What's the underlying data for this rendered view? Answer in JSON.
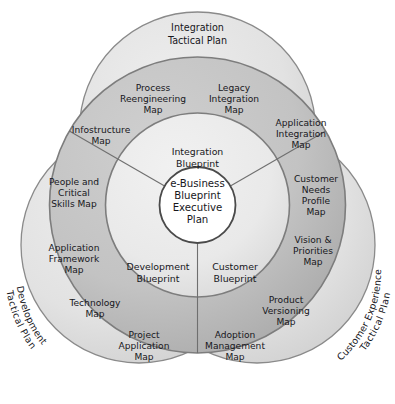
{
  "diagram": {
    "title": "e-Business Blueprint Executive Plan",
    "type": "concentric-venn-radial",
    "colors": {
      "outer_petal_fill": "#e2e2e2",
      "outer_petal_stroke": "#8a8a8a",
      "middle_ring_fill": "#c2c2c2",
      "middle_ring_stroke": "#7d7d7d",
      "inner_ring_fill": "#ebebeb",
      "inner_ring_stroke": "#7d7d7d",
      "center_fill": "#ffffff",
      "center_stroke": "#4a4a4a",
      "text": "#17171c"
    },
    "center": {
      "line1": "e-Business",
      "line2": "Blueprint",
      "line3": "Executive",
      "line4": "Plan"
    },
    "inner_ring": {
      "sectors": [
        {
          "id": "integration-blueprint",
          "line1": "Integration",
          "line2": "Blueprint"
        },
        {
          "id": "customer-blueprint",
          "line1": "Customer",
          "line2": "Blueprint"
        },
        {
          "id": "development-blueprint",
          "line1": "Development",
          "line2": "Blueprint"
        }
      ]
    },
    "middle_ring": {
      "sectors": [
        {
          "id": "integration-sector",
          "maps": [
            {
              "id": "infostructure-map",
              "lines": [
                "Infostructure",
                "Map"
              ]
            },
            {
              "id": "process-reengineering-map",
              "lines": [
                "Process",
                "Reengineering",
                "Map"
              ]
            },
            {
              "id": "legacy-integration-map",
              "lines": [
                "Legacy",
                "Integration",
                "Map"
              ]
            },
            {
              "id": "application-integration-map",
              "lines": [
                "Application",
                "Integration",
                "Map"
              ]
            }
          ]
        },
        {
          "id": "customer-sector",
          "maps": [
            {
              "id": "customer-needs-profile-map",
              "lines": [
                "Customer",
                "Needs",
                "Profile",
                "Map"
              ]
            },
            {
              "id": "vision-and-priorities-map",
              "lines": [
                "Vision &",
                "Priorities",
                "Map"
              ]
            },
            {
              "id": "product-versioning-map",
              "lines": [
                "Product",
                "Versioning",
                "Map"
              ]
            },
            {
              "id": "adoption-management-map",
              "lines": [
                "Adoption",
                "Management",
                "Map"
              ]
            }
          ]
        },
        {
          "id": "development-sector",
          "maps": [
            {
              "id": "project-application-map",
              "lines": [
                "Project",
                "Application",
                "Map"
              ]
            },
            {
              "id": "technology-map",
              "lines": [
                "Technology",
                "Map"
              ]
            },
            {
              "id": "application-framework-map",
              "lines": [
                "Application",
                "Framework",
                "Map"
              ]
            },
            {
              "id": "people-and-critical-skills-map",
              "lines": [
                "People and",
                "Critical",
                "Skills Map"
              ]
            }
          ]
        }
      ]
    },
    "outer_petals": [
      {
        "id": "integration-tactical-plan",
        "line1": "Integration",
        "line2": "Tactical Plan"
      },
      {
        "id": "customer-experience-tactical-plan",
        "line1": "Customer Experience",
        "line2": "Tactical Plan"
      },
      {
        "id": "development-tactical-plan",
        "line1": "Development",
        "line2": "Tactical Plan"
      }
    ]
  }
}
